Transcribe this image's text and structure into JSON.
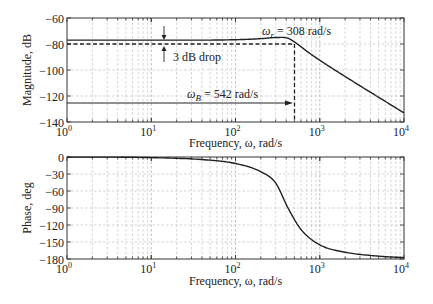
{
  "chart_data": [
    {
      "type": "line",
      "title": "",
      "xlabel": "Frequency, ω, rad/s",
      "ylabel": "Magnitude, dB",
      "xscale": "log",
      "xlim": [
        1,
        10000
      ],
      "ylim": [
        -140,
        -60
      ],
      "xticks": [
        1,
        10,
        100,
        1000,
        10000
      ],
      "xtick_labels": [
        "10^0",
        "10^1",
        "10^2",
        "10^3",
        "10^4"
      ],
      "yticks": [
        -60,
        -80,
        -100,
        -120,
        -140
      ],
      "ytick_labels": [
        "-60",
        "-80",
        "-100",
        "-120",
        "-140"
      ],
      "grid": true,
      "series": [
        {
          "name": "Magnitude",
          "x": [
            1,
            10,
            100,
            200,
            308,
            420,
            542,
            700,
            1000,
            2000,
            5000,
            10000
          ],
          "y": [
            -77,
            -77,
            -76.7,
            -75.9,
            -75,
            -75.6,
            -80,
            -85.5,
            -92.5,
            -105,
            -121,
            -133
          ]
        }
      ],
      "annotations": [
        {
          "text": "3 dB drop",
          "type": "arrows-between-levels",
          "levels": [
            -77,
            -80
          ],
          "x": 15
        },
        {
          "text": "ω_r = 308 rad/s",
          "x": 308
        },
        {
          "text": "ω_B = 542 rad/s",
          "type": "arrow",
          "y": -125,
          "x_end": 542
        },
        {
          "type": "dashed-line",
          "y": -80,
          "x_range": [
            1,
            542
          ]
        },
        {
          "type": "dashed-vline",
          "x": 542,
          "y_range": [
            -80,
            -140
          ]
        }
      ]
    },
    {
      "type": "line",
      "title": "",
      "xlabel": "Frequency, ω, rad/s",
      "ylabel": "Phase, deg",
      "xscale": "log",
      "xlim": [
        1,
        10000
      ],
      "ylim": [
        -180,
        0
      ],
      "xticks": [
        1,
        10,
        100,
        1000,
        10000
      ],
      "xtick_labels": [
        "10^0",
        "10^1",
        "10^2",
        "10^3",
        "10^4"
      ],
      "yticks": [
        0,
        -30,
        -60,
        -90,
        -120,
        -150,
        -180
      ],
      "ytick_labels": [
        "0",
        "-30",
        "-60",
        "-90",
        "-120",
        "-150",
        "-180"
      ],
      "grid": true,
      "series": [
        {
          "name": "Phase",
          "x": [
            1,
            10,
            50,
            100,
            200,
            300,
            420,
            600,
            1000,
            2000,
            5000,
            10000
          ],
          "y": [
            -0.1,
            -1.1,
            -5.6,
            -11.5,
            -26,
            -46,
            -90,
            -128,
            -155,
            -168,
            -175,
            -177.6
          ]
        }
      ]
    }
  ],
  "magnitude_plot": {
    "ylabel": "Magnitude, dB",
    "xlabel": "Frequency, ω, rad/s",
    "yticks": [
      "−60",
      "−80",
      "−100",
      "−120",
      "−140"
    ],
    "annotations": {
      "drop": "3 dB drop",
      "wr_symbol": "ω",
      "wr_sub": "r",
      "wr_value": " = 308 rad/s",
      "wb_symbol": "ω",
      "wb_sub": "B",
      "wb_value": " = 542 rad/s"
    }
  },
  "phase_plot": {
    "ylabel": "Phase, deg",
    "xlabel": "Frequency, ω, rad/s",
    "yticks": [
      "0",
      "−30",
      "−60",
      "−90",
      "−120",
      "−150",
      "−180"
    ]
  },
  "xaxis": {
    "base": "10",
    "exponents": [
      "0",
      "1",
      "2",
      "3",
      "4"
    ]
  }
}
